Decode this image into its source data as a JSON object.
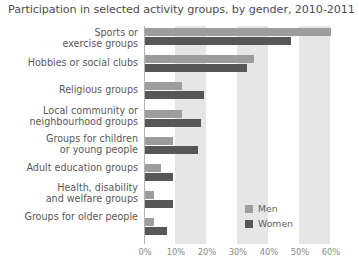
{
  "chart_data": {
    "type": "bar",
    "orientation": "horizontal",
    "title": "Participation in selected activity groups, by gender, 2010-2011",
    "xlabel": "",
    "ylabel": "",
    "xlim": [
      0,
      60
    ],
    "xticks": [
      "0%",
      "10%",
      "20%",
      "30%",
      "40%",
      "50%",
      "60%"
    ],
    "xtick_values": [
      0,
      10,
      20,
      30,
      40,
      50,
      60
    ],
    "grid": false,
    "bands": "alternating vertical shading between 10-20%, 30-40%, 50-60%",
    "legend_position": "bottom-right",
    "categories": [
      "Sports or\nexercise groups",
      "Hobbies or social clubs",
      "Religious groups",
      "Local community or\nneighbourhood groups",
      "Groups for children\nor young people",
      "Adult education groups",
      "Health, disability\nand welfare groups",
      "Groups for older people"
    ],
    "category_lines": [
      [
        "Sports or",
        "exercise groups"
      ],
      [
        "Hobbies or social clubs"
      ],
      [
        "Religious groups"
      ],
      [
        "Local community or",
        "neighbourhood groups"
      ],
      [
        "Groups for children",
        "or young people"
      ],
      [
        "Adult education groups"
      ],
      [
        "Health, disability",
        "and welfare groups"
      ],
      [
        "Groups for older people"
      ]
    ],
    "series": [
      {
        "name": "Men",
        "color": "#9d9d9d",
        "values": [
          60,
          35,
          12,
          12,
          9,
          5,
          3,
          3
        ]
      },
      {
        "name": "Women",
        "color": "#575757",
        "values": [
          47,
          33,
          19,
          18,
          17,
          9,
          9,
          7
        ]
      }
    ]
  },
  "legend": {
    "items": [
      {
        "label": "Men",
        "color": "#9d9d9d"
      },
      {
        "label": "Women",
        "color": "#575757"
      }
    ]
  }
}
